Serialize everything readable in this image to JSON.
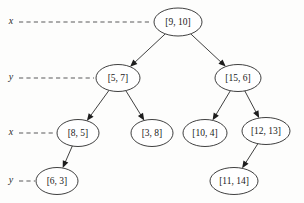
{
  "diagram": {
    "type": "kd-tree",
    "title": "",
    "background_color": "#fdfdfc",
    "stroke_color": "#1d1d1d",
    "dash_color": "#5a5a5a",
    "nodes": [
      {
        "id": "n0",
        "label": "[9, 10]",
        "cx": 178,
        "cy": 22,
        "rx": 24,
        "ry": 14,
        "level": 0
      },
      {
        "id": "n1",
        "label": "[5, 7]",
        "cx": 118,
        "cy": 78,
        "rx": 22,
        "ry": 13.5,
        "level": 1
      },
      {
        "id": "n2",
        "label": "[15, 6]",
        "cx": 238,
        "cy": 78,
        "rx": 23,
        "ry": 13.5,
        "level": 1
      },
      {
        "id": "n3",
        "label": "[8, 5]",
        "cx": 78,
        "cy": 133,
        "rx": 21,
        "ry": 13.5,
        "level": 2
      },
      {
        "id": "n4",
        "label": "[3, 8]",
        "cx": 152,
        "cy": 133,
        "rx": 21,
        "ry": 13.5,
        "level": 2
      },
      {
        "id": "n5",
        "label": "[10, 4]",
        "cx": 205,
        "cy": 133,
        "rx": 22,
        "ry": 13.5,
        "level": 2
      },
      {
        "id": "n6",
        "label": "[12, 13]",
        "cx": 266,
        "cy": 131,
        "rx": 24,
        "ry": 13.5,
        "level": 2
      },
      {
        "id": "n7",
        "label": "[6, 3]",
        "cx": 57,
        "cy": 181,
        "rx": 21,
        "ry": 13.5,
        "level": 3
      },
      {
        "id": "n8",
        "label": "[11, 14]",
        "cx": 234,
        "cy": 181,
        "rx": 24,
        "ry": 13.5,
        "level": 3
      }
    ],
    "edges": [
      {
        "from": "n0",
        "to": "n1"
      },
      {
        "from": "n0",
        "to": "n2"
      },
      {
        "from": "n1",
        "to": "n3"
      },
      {
        "from": "n1",
        "to": "n4"
      },
      {
        "from": "n2",
        "to": "n5"
      },
      {
        "from": "n2",
        "to": "n6"
      },
      {
        "from": "n3",
        "to": "n7"
      },
      {
        "from": "n6",
        "to": "n8"
      }
    ],
    "axis_markers": [
      {
        "id": "a0",
        "label": "x",
        "label_x": 11,
        "label_y": 22,
        "line_x1": 19,
        "line_x2": 150,
        "line_y": 22
      },
      {
        "id": "a1",
        "label": "y",
        "label_x": 11,
        "label_y": 78,
        "line_x1": 19,
        "line_x2": 94,
        "line_y": 78
      },
      {
        "id": "a2",
        "label": "x",
        "label_x": 11,
        "label_y": 133,
        "line_x1": 19,
        "line_x2": 56,
        "line_y": 133
      },
      {
        "id": "a3",
        "label": "y",
        "label_x": 11,
        "label_y": 181,
        "line_x1": 19,
        "line_x2": 35,
        "line_y": 181
      }
    ]
  }
}
